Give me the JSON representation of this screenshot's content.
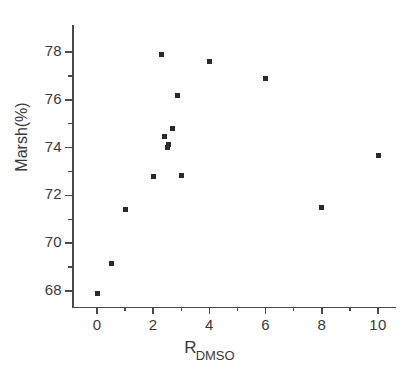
{
  "chart_data": {
    "type": "scatter",
    "title": "",
    "xlabel": "R_DMSO",
    "xlabel_base": "R",
    "xlabel_subscript": "DMSO",
    "ylabel": "Marsh(%)",
    "xlim": [
      -1,
      11.5
    ],
    "ylim": [
      66.9,
      78.9
    ],
    "grid": false,
    "legend": "none",
    "marker": "square",
    "marker_color": "#2b2b2b",
    "axis_color": "#4a4a4a",
    "background": "#ffffff",
    "x_ticks_major": [
      0,
      2,
      4,
      6,
      8,
      10
    ],
    "x_ticks_minor": [
      1,
      3,
      5,
      7,
      9,
      11
    ],
    "y_ticks_major": [
      68,
      70,
      72,
      74,
      76,
      78
    ],
    "y_ticks_minor": [
      67,
      69,
      71,
      73,
      75,
      77
    ],
    "points": [
      {
        "x": 0.0,
        "y": 67.9
      },
      {
        "x": 0.5,
        "y": 69.15
      },
      {
        "x": 1.0,
        "y": 71.4
      },
      {
        "x": 2.0,
        "y": 72.8
      },
      {
        "x": 2.3,
        "y": 77.9
      },
      {
        "x": 2.4,
        "y": 74.45
      },
      {
        "x": 2.55,
        "y": 74.15
      },
      {
        "x": 2.5,
        "y": 74.0
      },
      {
        "x": 2.7,
        "y": 74.8
      },
      {
        "x": 2.85,
        "y": 76.2
      },
      {
        "x": 3.0,
        "y": 72.85
      },
      {
        "x": 4.0,
        "y": 77.6
      },
      {
        "x": 6.0,
        "y": 76.9
      },
      {
        "x": 8.0,
        "y": 71.5
      },
      {
        "x": 10.0,
        "y": 73.65
      }
    ]
  }
}
